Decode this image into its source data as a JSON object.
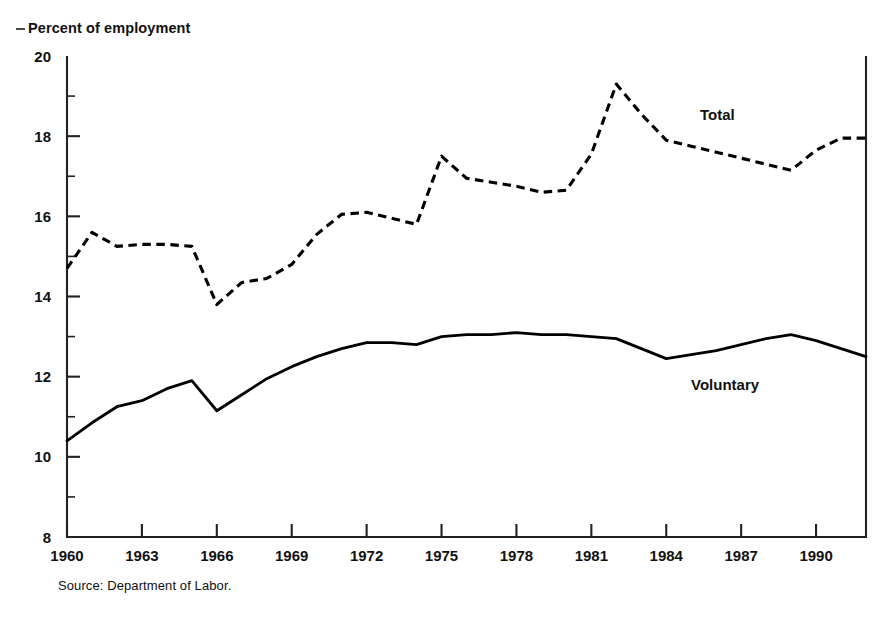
{
  "figure": {
    "cut_off_title_fragment": "g, p  y",
    "axis_title": "Percent of employment",
    "source_note": "Source: Department of Labor.",
    "series_label_total": "Total",
    "series_label_voluntary": "Voluntary"
  },
  "axes": {
    "y_ticks": [
      "20",
      "18",
      "16",
      "14",
      "12",
      "10",
      "8"
    ],
    "x_ticks": [
      "1960",
      "1963",
      "1966",
      "1969",
      "1972",
      "1975",
      "1978",
      "1981",
      "1984",
      "1987",
      "1990"
    ]
  },
  "chart_data": {
    "type": "line",
    "title": "Percent of employment",
    "xlabel": "",
    "ylabel": "Percent of employment",
    "xlim": [
      1960,
      1992
    ],
    "ylim": [
      8,
      20
    ],
    "ytick_step": 2,
    "yminor_step": 1,
    "xtick_step": 3,
    "grid": false,
    "legend": "inline-annotation",
    "source": "Source: Department of Labor.",
    "x": [
      1960,
      1961,
      1962,
      1963,
      1964,
      1965,
      1966,
      1967,
      1968,
      1969,
      1970,
      1971,
      1972,
      1973,
      1974,
      1975,
      1976,
      1977,
      1978,
      1979,
      1980,
      1981,
      1982,
      1983,
      1984,
      1985,
      1986,
      1987,
      1988,
      1989,
      1990,
      1991,
      1992
    ],
    "series": [
      {
        "name": "Total",
        "style": "dashed",
        "values": [
          14.7,
          15.6,
          15.25,
          15.3,
          15.3,
          15.25,
          13.8,
          14.35,
          14.45,
          14.8,
          15.55,
          16.05,
          16.1,
          15.95,
          15.8,
          17.5,
          16.95,
          16.85,
          16.75,
          16.6,
          16.65,
          17.55,
          19.3,
          18.55,
          17.9,
          17.75,
          17.6,
          17.45,
          17.3,
          17.15,
          17.65,
          17.95,
          17.95
        ]
      },
      {
        "name": "Voluntary",
        "style": "solid",
        "values": [
          10.4,
          10.85,
          11.25,
          11.4,
          11.7,
          11.9,
          11.15,
          11.55,
          11.95,
          12.25,
          12.5,
          12.7,
          12.85,
          12.85,
          12.8,
          13.0,
          13.05,
          13.05,
          13.1,
          13.05,
          13.05,
          13.0,
          12.95,
          12.7,
          12.45,
          12.55,
          12.65,
          12.8,
          12.95,
          13.05,
          12.9,
          12.7,
          12.5
        ]
      }
    ]
  }
}
